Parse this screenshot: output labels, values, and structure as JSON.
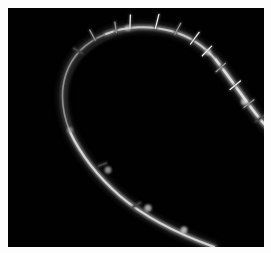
{
  "image": {
    "kind": "darkfield-micrograph",
    "subject": "barbed-fiber-loop",
    "alt_text": "Dark-field micrograph of a single barbed fiber bent into a large open loop against a black background",
    "width": 271,
    "height": 253,
    "background_color": "#ffffff",
    "field_color": "#010101",
    "field": {
      "x": 8,
      "y": 8,
      "width": 256,
      "height": 239
    }
  },
  "palette": {
    "background_white": "#ffffff",
    "field_black": "#010101",
    "fiber_bright": "#e8e8e8",
    "fiber_mid": "#9a9a9a",
    "fiber_dim": "#4a4a4a",
    "fiber_faint": "#2a2a2a",
    "barb_highlight": "#f2f2f2",
    "halo": "#1a1a1a"
  },
  "fiber": {
    "description": "Single filament entering at bottom-left, curving up the left side, around a broad apex at the top, then descending diagonally to the right edge",
    "entry_point": "bottom-left",
    "exit_point": "right-edge",
    "loop_orientation": "open loop, apex at top-center-left",
    "segments": [
      {
        "name": "lower-left-limb",
        "brightness": "bright",
        "path": "M 206 239 C 176 228, 140 212, 112 188 C 88 167, 72 145, 62 124",
        "stroke_core": "#d6d6d6",
        "stroke_outer": "#7c7c7c",
        "width_core": 2.2,
        "width_outer": 5.0
      },
      {
        "name": "left-bend",
        "brightness": "faint",
        "path": "M 62 124 C 54 104, 52 84, 58 66 C 64 48, 78 34, 98 26",
        "stroke_core": "#8f8f8f",
        "stroke_outer": "#3f3f3f",
        "width_core": 1.6,
        "width_outer": 4.2
      },
      {
        "name": "apex",
        "brightness": "mid",
        "path": "M 98 26 C 118 18, 142 17, 163 23 C 182 28, 196 38, 208 52",
        "stroke_core": "#c8c8c8",
        "stroke_outer": "#6e6e6e",
        "width_core": 2.0,
        "width_outer": 5.0
      },
      {
        "name": "right-descending-limb",
        "brightness": "bright",
        "path": "M 208 52 C 222 70, 234 88, 248 106 C 254 114, 258 118, 262 122",
        "stroke_core": "#dedede",
        "stroke_outer": "#858585",
        "width_core": 2.6,
        "width_outer": 6.0
      }
    ],
    "inner_shadow_path": "M 200 236 C 168 224, 132 204, 106 180 C 84 159, 68 136, 62 114 C 56 92, 58 72, 68 56 C 80 38, 102 26, 128 22",
    "barbs": [
      {
        "id": 1,
        "x": 86,
        "y": 30,
        "angle": -118,
        "length": 9,
        "brightness": "mid"
      },
      {
        "id": 2,
        "x": 108,
        "y": 22,
        "angle": -98,
        "length": 8,
        "brightness": "mid"
      },
      {
        "id": 3,
        "x": 122,
        "y": 18,
        "angle": -88,
        "length": 11,
        "brightness": "bright"
      },
      {
        "id": 4,
        "x": 148,
        "y": 18,
        "angle": -76,
        "length": 12,
        "brightness": "bright"
      },
      {
        "id": 5,
        "x": 168,
        "y": 24,
        "angle": -62,
        "length": 10,
        "brightness": "mid"
      },
      {
        "id": 6,
        "x": 184,
        "y": 34,
        "angle": -54,
        "length": 12,
        "brightness": "bright"
      },
      {
        "id": 7,
        "x": 196,
        "y": 46,
        "angle": -46,
        "length": 11,
        "brightness": "bright"
      },
      {
        "id": 8,
        "x": 210,
        "y": 62,
        "angle": -42,
        "length": 10,
        "brightness": "mid"
      },
      {
        "id": 9,
        "x": 224,
        "y": 80,
        "angle": -40,
        "length": 11,
        "brightness": "bright"
      },
      {
        "id": 10,
        "x": 238,
        "y": 98,
        "angle": -38,
        "length": 10,
        "brightness": "mid"
      },
      {
        "id": 11,
        "x": 250,
        "y": 112,
        "angle": -36,
        "length": 9,
        "brightness": "dim"
      },
      {
        "id": 12,
        "x": 72,
        "y": 44,
        "angle": -150,
        "length": 7,
        "brightness": "dim"
      },
      {
        "id": 13,
        "x": 96,
        "y": 156,
        "angle": 160,
        "length": 6,
        "brightness": "dim"
      },
      {
        "id": 14,
        "x": 130,
        "y": 196,
        "angle": 150,
        "length": 6,
        "brightness": "dim"
      }
    ],
    "bright_nodes": [
      {
        "x": 62,
        "y": 122,
        "r": 3.0,
        "opacity": 0.45
      },
      {
        "x": 100,
        "y": 162,
        "r": 3.4,
        "opacity": 0.6
      },
      {
        "x": 140,
        "y": 200,
        "r": 3.6,
        "opacity": 0.7
      },
      {
        "x": 176,
        "y": 222,
        "r": 3.4,
        "opacity": 0.72
      },
      {
        "x": 120,
        "y": 20,
        "r": 3.0,
        "opacity": 0.55
      },
      {
        "x": 200,
        "y": 44,
        "r": 3.2,
        "opacity": 0.62
      },
      {
        "x": 236,
        "y": 94,
        "r": 3.2,
        "opacity": 0.66
      }
    ]
  }
}
